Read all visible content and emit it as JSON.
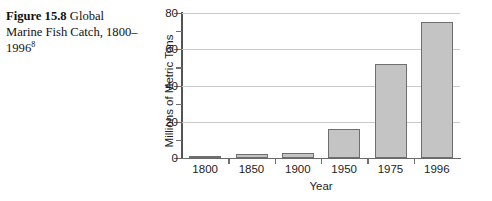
{
  "caption": {
    "figure_number": "Figure 15.8",
    "text": "Global Marine Fish Catch, 1800–1996",
    "footnote_marker": "8"
  },
  "chart_data": {
    "type": "bar",
    "title": "Global Marine Fish Catch, 1800–1996",
    "categories": [
      "1800",
      "1850",
      "1900",
      "1950",
      "1975",
      "1996"
    ],
    "values": [
      1,
      2,
      3,
      16,
      52,
      75
    ],
    "xlabel": "Year",
    "ylabel": "Millions of Metric Tons",
    "ylim": [
      0,
      80
    ],
    "ytick_labels": [
      "0",
      "20",
      "40",
      "60",
      "80"
    ],
    "ytick_values": [
      0,
      20,
      40,
      60,
      80
    ],
    "minor_tick_values": [
      10,
      30,
      50,
      70
    ],
    "grid": "horizontal-major",
    "legend": "none",
    "bar_fill_color": "#c4c4c4",
    "bar_edge_color": "#6e6e6e",
    "grid_color": "#c9c9c9",
    "axis_color": "#545454",
    "background_color": "#ffffff"
  }
}
